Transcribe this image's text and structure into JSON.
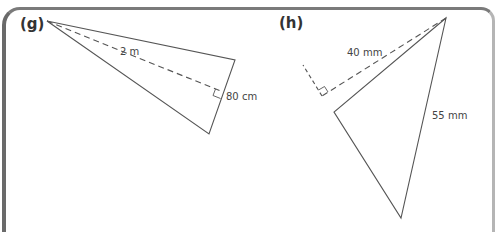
{
  "figures": [
    {
      "id": "g",
      "label": "(g)",
      "measurements": {
        "height": "2 m",
        "base": "80 cm"
      }
    },
    {
      "id": "h",
      "label": "(h)",
      "measurements": {
        "height": "40 mm",
        "base": "55 mm"
      }
    }
  ],
  "colors": {
    "line": "#555555",
    "frame_dark": "#6a6a6a",
    "frame_light": "#b5b5b5",
    "text": "#333333"
  }
}
